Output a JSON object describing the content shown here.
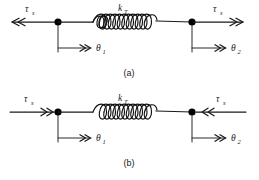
{
  "figure": {
    "background_color": "#ffffff",
    "line_color": "#1a1a1a",
    "node_color": "#000000",
    "panels": [
      {
        "id": "a",
        "caption": "(a)",
        "description": "Torsional spring element with equal and opposite torques applied outward at both ends",
        "spring_label": "k",
        "spring_label_sub": "T",
        "spring_coils": 6,
        "left_torque": {
          "symbol": "τ",
          "sub": "s",
          "label": "τs",
          "arrow_direction": "left",
          "arrow_head": "double-chevron"
        },
        "right_torque": {
          "symbol": "τ",
          "sub": "s",
          "label": "τs",
          "arrow_direction": "right",
          "arrow_head": "double-chevron"
        },
        "left_angle": {
          "symbol": "θ",
          "sub": "1",
          "label": "θ1",
          "arrow_direction": "right",
          "arrow_head": "double-chevron"
        },
        "right_angle": {
          "symbol": "θ",
          "sub": "2",
          "label": "θ2",
          "arrow_direction": "right",
          "arrow_head": "double-chevron"
        }
      },
      {
        "id": "b",
        "caption": "(b)",
        "description": "Torsional spring element with equal and opposite torques applied inward at both ends",
        "spring_label": "k",
        "spring_label_sub": "T",
        "spring_coils": 6,
        "left_torque": {
          "symbol": "τ",
          "sub": "s",
          "label": "τs",
          "arrow_direction": "right",
          "arrow_head": "double-chevron"
        },
        "right_torque": {
          "symbol": "τ",
          "sub": "s",
          "label": "τs",
          "arrow_direction": "left",
          "arrow_head": "double-chevron"
        },
        "left_angle": {
          "symbol": "θ",
          "sub": "1",
          "label": "θ1",
          "arrow_direction": "right",
          "arrow_head": "double-chevron"
        },
        "right_angle": {
          "symbol": "θ",
          "sub": "2",
          "label": "θ2",
          "arrow_direction": "right",
          "arrow_head": "double-chevron"
        }
      }
    ]
  }
}
